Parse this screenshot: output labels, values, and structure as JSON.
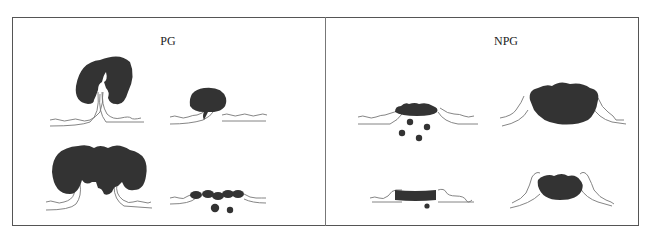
{
  "figure": {
    "panels": [
      {
        "title": "PG",
        "center_x": 168,
        "items": [
          {
            "id": "pg-top-left",
            "description": "large curled mass with cleft"
          },
          {
            "id": "pg-top-right",
            "description": "rounded mass with small stalk"
          },
          {
            "id": "pg-bottom-left",
            "description": "broad lobulated mass"
          },
          {
            "id": "pg-bottom-right",
            "description": "flat beaded mass with droplets"
          }
        ]
      },
      {
        "title": "NPG",
        "center_x": 506,
        "items": [
          {
            "id": "npg-top-left",
            "description": "flat mass with scattered droplets"
          },
          {
            "id": "npg-top-right",
            "description": "large domed mass"
          },
          {
            "id": "npg-bottom-left",
            "description": "flat band with single droplet"
          },
          {
            "id": "npg-bottom-right",
            "description": "compact lobulated mass"
          }
        ]
      }
    ],
    "colors": {
      "fill": "#333333",
      "line": "#666666",
      "border": "#555555"
    }
  }
}
